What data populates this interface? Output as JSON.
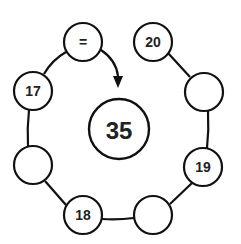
{
  "puzzle": {
    "center": {
      "value": "35",
      "x": 119,
      "y": 129,
      "r": 30
    },
    "nodes": [
      {
        "id": "top-left",
        "label": "=",
        "x": 83,
        "y": 42
      },
      {
        "id": "top-right",
        "label": "20",
        "x": 153,
        "y": 42
      },
      {
        "id": "right-upper",
        "label": "",
        "x": 204,
        "y": 92
      },
      {
        "id": "right-lower",
        "label": "19",
        "x": 203,
        "y": 167
      },
      {
        "id": "bottom-right",
        "label": "",
        "x": 153,
        "y": 215
      },
      {
        "id": "bottom-left",
        "label": "18",
        "x": 83,
        "y": 215
      },
      {
        "id": "left-lower",
        "label": "",
        "x": 33,
        "y": 165
      },
      {
        "id": "left-upper",
        "label": "17",
        "x": 33,
        "y": 91
      }
    ],
    "node_radius": 19,
    "colors": {
      "stroke": "#111111",
      "fill": "#ffffff",
      "text": "#222222"
    }
  }
}
